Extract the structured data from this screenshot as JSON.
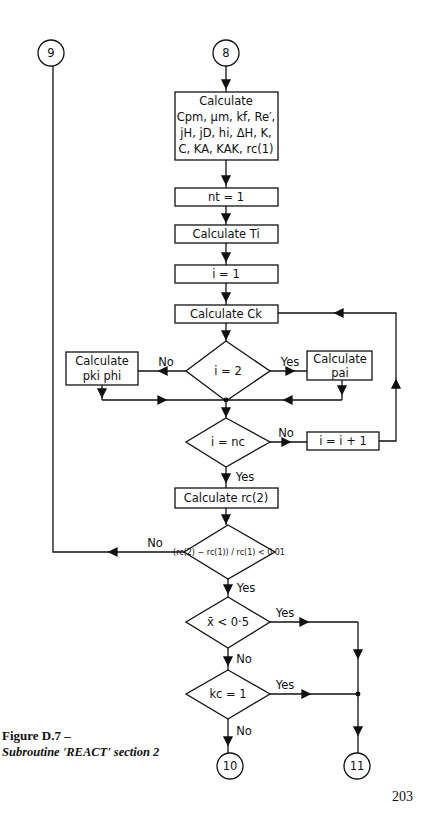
{
  "figure": {
    "title": "Figure D.7 –",
    "subtitle": "Subroutine 'REACT' section 2",
    "page_number": "203"
  },
  "connectors": {
    "c8": "8",
    "c9": "9",
    "c10": "10",
    "c11": "11"
  },
  "boxes": {
    "calc_props": {
      "line1": "Calculate",
      "line2": "Cpm, μm, kf, Re′,",
      "line3": "jH, jD, hi, ΔH, K,",
      "line4": "C, KA, KAK, rc(1)"
    },
    "nt_init": "nt = 1",
    "calc_Ti": "Calculate Ti",
    "i_init": "i = 1",
    "calc_Ck": "Calculate Ck",
    "calc_pki_phi": {
      "line1": "Calculate",
      "line2": "pki phi"
    },
    "calc_pai": {
      "line1": "Calculate",
      "line2": "pai"
    },
    "i_incr": "i = i + 1",
    "calc_rc2": "Calculate rc(2)"
  },
  "decisions": {
    "i_eq_2": "i = 2",
    "i_eq_nc": "i = nc",
    "convergence": "(rc(2) − rc(1)) / rc(1) < 0·01",
    "xbar": "x̄ < 0·5",
    "kc": "kc = 1"
  },
  "labels": {
    "yes": "Yes",
    "no": "No"
  }
}
